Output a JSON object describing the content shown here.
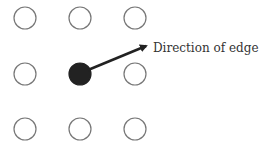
{
  "diagram": {
    "nodes": [
      {
        "row": 0,
        "col": 0,
        "cx": 25,
        "cy": 18,
        "filled": false
      },
      {
        "row": 0,
        "col": 1,
        "cx": 80,
        "cy": 18,
        "filled": false
      },
      {
        "row": 0,
        "col": 2,
        "cx": 135,
        "cy": 18,
        "filled": false
      },
      {
        "row": 1,
        "col": 0,
        "cx": 25,
        "cy": 74,
        "filled": false
      },
      {
        "row": 1,
        "col": 1,
        "cx": 80,
        "cy": 74,
        "filled": true
      },
      {
        "row": 1,
        "col": 2,
        "cx": 135,
        "cy": 74,
        "filled": false
      },
      {
        "row": 2,
        "col": 0,
        "cx": 25,
        "cy": 129,
        "filled": false
      },
      {
        "row": 2,
        "col": 1,
        "cx": 80,
        "cy": 129,
        "filled": false
      },
      {
        "row": 2,
        "col": 2,
        "cx": 135,
        "cy": 129,
        "filled": false
      }
    ],
    "arrow": {
      "x1": 88,
      "y1": 70,
      "x2": 146,
      "y2": 46
    },
    "label": "Direction of edge",
    "colors": {
      "outline": "#777777",
      "fill": "#222222",
      "arrow": "#222222",
      "text": "#333333"
    }
  }
}
